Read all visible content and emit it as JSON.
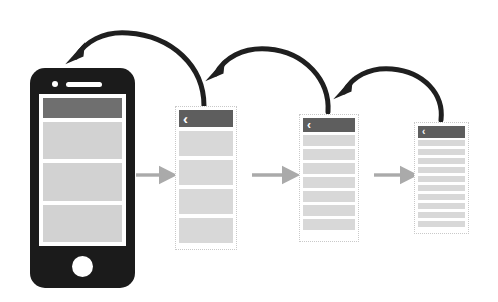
{
  "diagram": {
    "background_color": "#ffffff"
  },
  "colors": {
    "phone_body": "#1b1b1b",
    "phone_screen": "#ffffff",
    "header_bar": "#5e5e5e",
    "content_row": "#d8d8d8",
    "forward_arrow": "#aaaaaa",
    "back_arrow": "#1f1f1f",
    "panel_border": "#c9c9c9"
  },
  "phone": {
    "name": "smartphone-mockup",
    "camera_icon": "camera-dot-icon",
    "speaker_icon": "speaker-slot-icon",
    "home_button_icon": "home-button-icon",
    "screen": {
      "header_label": "",
      "blocks": [
        "",
        "",
        ""
      ]
    }
  },
  "panels": [
    {
      "id": "panel-2",
      "name": "wireframe-screen-level-1",
      "back_icon": "chevron-left-icon",
      "back_label": "‹",
      "rows": [
        "",
        "",
        "",
        ""
      ]
    },
    {
      "id": "panel-3",
      "name": "wireframe-screen-level-2",
      "back_icon": "chevron-left-icon",
      "back_label": "‹",
      "rows": [
        "",
        "",
        "",
        "",
        "",
        "",
        ""
      ]
    },
    {
      "id": "panel-4",
      "name": "wireframe-screen-level-3",
      "back_icon": "chevron-left-icon",
      "back_label": "‹",
      "rows": [
        "",
        "",
        "",
        "",
        "",
        "",
        "",
        "",
        "",
        ""
      ]
    }
  ],
  "forward_arrows": [
    {
      "name": "forward-arrow-phone-to-level1",
      "label": ""
    },
    {
      "name": "forward-arrow-level1-to-level2",
      "label": ""
    },
    {
      "name": "forward-arrow-level2-to-level3",
      "label": ""
    }
  ],
  "back_arrows": [
    {
      "name": "back-arrow-level1-to-phone",
      "label": ""
    },
    {
      "name": "back-arrow-level2-to-level1",
      "label": ""
    },
    {
      "name": "back-arrow-level3-to-level2",
      "label": ""
    }
  ]
}
